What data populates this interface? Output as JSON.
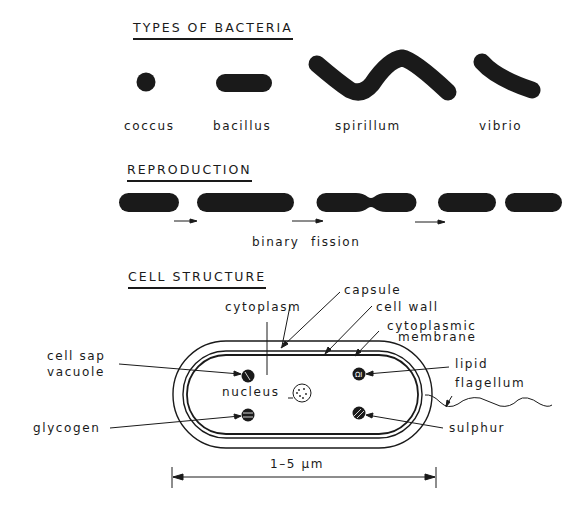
{
  "sections": {
    "types": {
      "heading": "TYPES OF BACTERIA",
      "items": [
        {
          "name": "coccus",
          "label": "coccus"
        },
        {
          "name": "bacillus",
          "label": "bacillus"
        },
        {
          "name": "spirillum",
          "label": "spirillum"
        },
        {
          "name": "vibrio",
          "label": "vibrio"
        }
      ]
    },
    "reproduction": {
      "heading": "REPRODUCTION",
      "caption": "binary fission"
    },
    "cell_structure": {
      "heading": "CELL STRUCTURE",
      "labels": {
        "capsule": "capsule",
        "cytoplasm": "cytoplasm",
        "cell_wall": "cell wall",
        "cytoplasmic_1": "cytoplasmic",
        "cytoplasmic_2": "membrane",
        "cell_sap_1": "cell sap",
        "cell_sap_2": "vacuole",
        "lipid": "lipid",
        "flagellum": "flagellum",
        "nucleus": "nucleus",
        "glycogen": "glycogen",
        "sulphur": "sulphur"
      },
      "dimension": "1–5 μm"
    }
  },
  "colors": {
    "ink": "#1a1a1a",
    "background": "#ffffff"
  }
}
